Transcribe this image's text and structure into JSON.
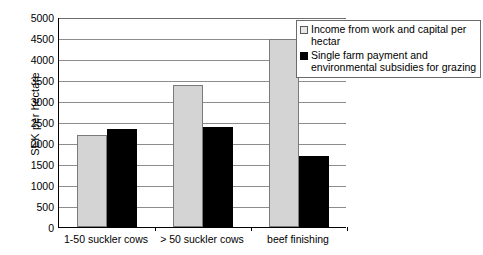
{
  "chart_data": {
    "type": "bar",
    "title": "",
    "subtitle": "",
    "xlabel": "",
    "ylabel": "SEK per hectare",
    "ylim": [
      0,
      5000
    ],
    "ytick_step": 500,
    "ytick_labels": [
      "5000",
      "4500",
      "4000",
      "3500",
      "3000",
      "2500",
      "2000",
      "1500",
      "1000",
      "500",
      "0"
    ],
    "grid": true,
    "legend_position": "top-right",
    "categories": [
      "1-50 suckler cows",
      "> 50 suckler cows",
      "beef finishing"
    ],
    "series": [
      {
        "name": "Income from work and capital per hectar",
        "color": "#d4d4d4",
        "values": [
          2180,
          3380,
          4470
        ]
      },
      {
        "name": "Single farm payment and environmental subsidies for grazing",
        "color": "#000000",
        "values": [
          2330,
          2390,
          1680
        ]
      }
    ]
  },
  "legend": {
    "entries": [
      {
        "label": "Income from work and capital per hectar",
        "swatch": "light-square-swatch"
      },
      {
        "label": "Single farm payment and environmental subsidies for grazing",
        "swatch": "black-square-swatch"
      }
    ]
  }
}
